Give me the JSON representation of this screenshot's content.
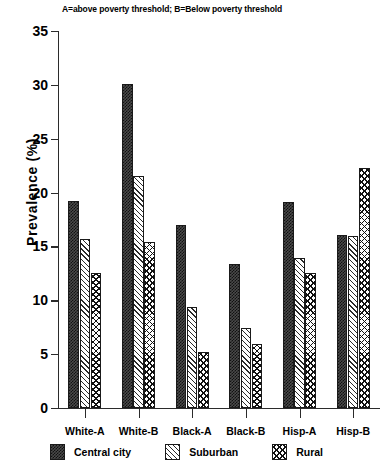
{
  "chart_data": {
    "type": "bar",
    "title": "A=above poverty threshold; B=Below poverty threshold",
    "xlabel": "",
    "ylabel": "Prevalence (%)",
    "ylim": [
      0,
      35
    ],
    "yticks": [
      0,
      5,
      10,
      15,
      20,
      25,
      30,
      35
    ],
    "ytick_labels": [
      "0",
      "5",
      "10",
      "15",
      "20",
      "25",
      "30",
      "35"
    ],
    "grid": false,
    "legend_position": "below-axis",
    "categories": [
      "White-A",
      "White-B",
      "Black-A",
      "Black-B",
      "Hisp-A",
      "Hisp-B"
    ],
    "series": [
      {
        "name": "Central city",
        "pattern": "dotted-checker",
        "values": [
          19.2,
          30.1,
          17.0,
          13.4,
          19.1,
          16.1
        ]
      },
      {
        "name": "Suburban",
        "pattern": "diagonal-hatch",
        "values": [
          15.7,
          21.5,
          9.4,
          7.4,
          13.9,
          16.0
        ]
      },
      {
        "name": "Rural",
        "pattern": "cross-hatch",
        "values": [
          12.5,
          15.4,
          5.2,
          5.9,
          12.5,
          22.3
        ]
      }
    ]
  }
}
